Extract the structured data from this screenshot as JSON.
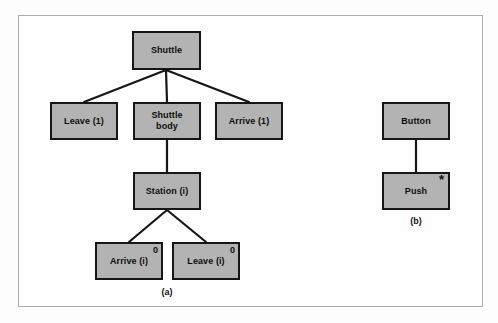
{
  "figure": {
    "background_color": "#fdfdfd",
    "frame_color": "#aeaeae",
    "node_fill": "#b3b3b3",
    "node_border": "#161616",
    "edge_color": "#161616"
  },
  "diagrams": [
    {
      "id": "a",
      "caption": "(a)",
      "nodes": [
        {
          "id": "shuttle",
          "label": "Shuttle",
          "corner": "",
          "x": 132,
          "y": 31,
          "w": 69,
          "h": 39
        },
        {
          "id": "leave-1",
          "label": "Leave (1)",
          "corner": "",
          "x": 50,
          "y": 102,
          "w": 68,
          "h": 38
        },
        {
          "id": "shuttle-body",
          "label": "Shuttle\nbody",
          "corner": "",
          "x": 133,
          "y": 102,
          "w": 68,
          "h": 38
        },
        {
          "id": "arrive-1",
          "label": "Arrive (1)",
          "corner": "",
          "x": 215,
          "y": 102,
          "w": 68,
          "h": 38
        },
        {
          "id": "station-i",
          "label": "Station (i)",
          "corner": "",
          "x": 133,
          "y": 172,
          "w": 68,
          "h": 38
        },
        {
          "id": "arrive-i",
          "label": "Arrive (i)",
          "corner": "0",
          "x": 95,
          "y": 242,
          "w": 68,
          "h": 38
        },
        {
          "id": "leave-i",
          "label": "Leave (i)",
          "corner": "0",
          "x": 172,
          "y": 242,
          "w": 68,
          "h": 38
        }
      ],
      "edges": [
        {
          "from": "shuttle",
          "to": "leave-1"
        },
        {
          "from": "shuttle",
          "to": "shuttle-body"
        },
        {
          "from": "shuttle",
          "to": "arrive-1"
        },
        {
          "from": "shuttle-body",
          "to": "station-i"
        },
        {
          "from": "station-i",
          "to": "arrive-i"
        },
        {
          "from": "station-i",
          "to": "leave-i"
        }
      ]
    },
    {
      "id": "b",
      "caption": "(b)",
      "nodes": [
        {
          "id": "button",
          "label": "Button",
          "corner": "",
          "x": 382,
          "y": 102,
          "w": 68,
          "h": 38
        },
        {
          "id": "push",
          "label": "Push",
          "corner": "*",
          "x": 382,
          "y": 172,
          "w": 68,
          "h": 38
        }
      ],
      "edges": [
        {
          "from": "button",
          "to": "push"
        }
      ]
    }
  ],
  "captions": {
    "a": "(a)",
    "b": "(b)"
  }
}
